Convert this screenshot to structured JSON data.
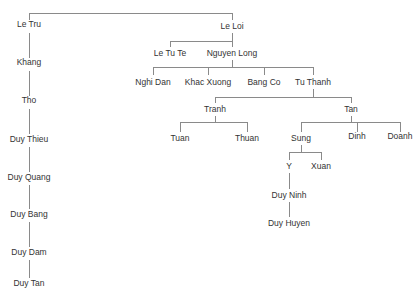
{
  "diagram": {
    "type": "family-tree",
    "line_color": "#8a8a8a",
    "text_color": "#333333",
    "nodes": [
      {
        "id": "le_tru",
        "label": "Le Tru",
        "x": 29,
        "y": 23
      },
      {
        "id": "khang",
        "label": "Khang",
        "x": 29,
        "y": 61
      },
      {
        "id": "tho",
        "label": "Tho",
        "x": 29,
        "y": 99
      },
      {
        "id": "duy_thieu",
        "label": "Duy Thieu",
        "x": 29,
        "y": 137
      },
      {
        "id": "duy_quang",
        "label": "Duy Quang",
        "x": 29,
        "y": 175
      },
      {
        "id": "duy_bang",
        "label": "Duy Bang",
        "x": 29,
        "y": 212
      },
      {
        "id": "duy_dam",
        "label": "Duy Dam",
        "x": 29,
        "y": 250
      },
      {
        "id": "duy_tan",
        "label": "Duy Tan",
        "x": 29,
        "y": 281
      },
      {
        "id": "le_loi",
        "label": "Le Loi",
        "x": 232,
        "y": 23
      },
      {
        "id": "le_tu_te",
        "label": "Le Tu Te",
        "x": 170,
        "y": 50
      },
      {
        "id": "nguyen_long",
        "label": "Nguyen Long",
        "x": 232,
        "y": 50
      },
      {
        "id": "nghi_dan",
        "label": "Nghi Dan",
        "x": 153,
        "y": 79
      },
      {
        "id": "khac_xuong",
        "label": "Khac Xuong",
        "x": 208,
        "y": 79
      },
      {
        "id": "bang_co",
        "label": "Bang Co",
        "x": 264,
        "y": 79
      },
      {
        "id": "tu_thanh",
        "label": "Tu Thanh",
        "x": 313,
        "y": 79
      },
      {
        "id": "tranh",
        "label": "Tranh",
        "x": 215,
        "y": 106
      },
      {
        "id": "tan",
        "label": "Tan",
        "x": 351,
        "y": 106
      },
      {
        "id": "tuan",
        "label": "Tuan",
        "x": 180,
        "y": 135
      },
      {
        "id": "thuan",
        "label": "Thuan",
        "x": 247,
        "y": 135
      },
      {
        "id": "sung",
        "label": "Sung",
        "x": 301,
        "y": 135
      },
      {
        "id": "dinh",
        "label": "Dinh",
        "x": 357,
        "y": 135
      },
      {
        "id": "doanh",
        "label": "Doanh",
        "x": 400,
        "y": 135
      },
      {
        "id": "y",
        "label": "Y",
        "x": 289,
        "y": 163
      },
      {
        "id": "xuan",
        "label": "Xuan",
        "x": 321,
        "y": 163
      },
      {
        "id": "duy_ninh",
        "label": "Duy Ninh",
        "x": 289,
        "y": 192
      },
      {
        "id": "duy_huyen",
        "label": "Duy Huyen",
        "x": 289,
        "y": 220
      }
    ],
    "edges": [
      [
        "le_loi",
        "le_tru"
      ],
      [
        "le_tru",
        "khang"
      ],
      [
        "khang",
        "tho"
      ],
      [
        "tho",
        "duy_thieu"
      ],
      [
        "duy_thieu",
        "duy_quang"
      ],
      [
        "duy_quang",
        "duy_bang"
      ],
      [
        "duy_bang",
        "duy_dam"
      ],
      [
        "duy_dam",
        "duy_tan"
      ],
      [
        "le_loi",
        "le_tu_te"
      ],
      [
        "le_loi",
        "nguyen_long"
      ],
      [
        "nguyen_long",
        "nghi_dan"
      ],
      [
        "nguyen_long",
        "khac_xuong"
      ],
      [
        "nguyen_long",
        "bang_co"
      ],
      [
        "nguyen_long",
        "tu_thanh"
      ],
      [
        "tu_thanh",
        "tranh"
      ],
      [
        "tu_thanh",
        "tan"
      ],
      [
        "tranh",
        "tuan"
      ],
      [
        "tranh",
        "thuan"
      ],
      [
        "tan",
        "sung"
      ],
      [
        "tan",
        "dinh"
      ],
      [
        "tan",
        "doanh"
      ],
      [
        "sung",
        "y"
      ],
      [
        "sung",
        "xuan"
      ],
      [
        "y",
        "duy_ninh"
      ],
      [
        "duy_ninh",
        "duy_huyen"
      ]
    ]
  }
}
